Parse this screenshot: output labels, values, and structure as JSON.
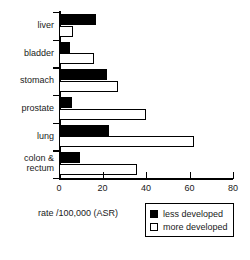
{
  "chart_data": {
    "type": "bar",
    "orientation": "horizontal",
    "title": "",
    "xlabel": "rate /100,000 (ASR)",
    "ylabel": "",
    "xlim": [
      0,
      80
    ],
    "xticks": [
      0,
      20,
      40,
      60,
      80
    ],
    "xtick_labels": [
      "0",
      "20",
      "40",
      "60",
      "80"
    ],
    "grid": false,
    "legend_position": "bottom-right",
    "categories": [
      "liver",
      "bladder",
      "stomach",
      "prostate",
      "lung",
      "colon &\nrectum"
    ],
    "series": [
      {
        "name": "less developed",
        "color": "#000000",
        "style": "filled",
        "values": [
          17,
          5,
          22,
          6,
          23,
          9.5
        ]
      },
      {
        "name": "more developed",
        "color": "#ffffff",
        "style": "hollow",
        "values": [
          6.5,
          16,
          27,
          40,
          62,
          36
        ]
      }
    ]
  },
  "legend": {
    "items": [
      {
        "label": "less developed",
        "swatch": "filled"
      },
      {
        "label": "more developed",
        "swatch": "hollow"
      }
    ]
  },
  "axis": {
    "x_title": "rate /100,000 (ASR)"
  }
}
